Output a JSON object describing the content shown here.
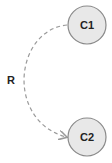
{
  "diagram": {
    "nodes": [
      {
        "id": "C1",
        "label": "C1",
        "cx": 87,
        "cy": 25,
        "r": 19
      },
      {
        "id": "C2",
        "label": "C2",
        "cx": 87,
        "cy": 137,
        "r": 19
      }
    ],
    "edges": [
      {
        "from": "C1",
        "to": "C2",
        "label": "R",
        "style": "dashed",
        "arrow": "end"
      }
    ],
    "edge_label": "R",
    "colors": {
      "node_fill": "#e8e8e8",
      "node_stroke": "#8a8a8a",
      "edge": "#9a9a9a",
      "text": "#222222"
    }
  }
}
